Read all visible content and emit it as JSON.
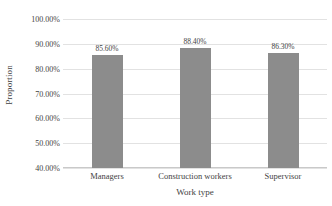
{
  "chart_data": {
    "type": "bar",
    "title": "",
    "categories": [
      "Managers",
      "Construction workers",
      "Supervisor"
    ],
    "values": [
      85.6,
      88.4,
      86.3
    ],
    "data_labels": [
      "85.60%",
      "88.40%",
      "86.30%"
    ],
    "xlabel": "Work type",
    "ylabel": "Proportion",
    "ylim": [
      40,
      100
    ],
    "ytick_values": [
      100,
      90,
      80,
      70,
      60,
      50,
      40
    ],
    "ytick_labels": [
      "100.00%",
      "90.00%",
      "80.00%",
      "70.00%",
      "60.00%",
      "50.00%",
      "40.00%"
    ],
    "grid": true,
    "legend": false,
    "bar_color": "#8c8c8c",
    "gridline_color": "#e2e2e2",
    "axis_color": "#c9c9c9",
    "text_color": "#3f3f3f",
    "background": "#ffffff"
  }
}
